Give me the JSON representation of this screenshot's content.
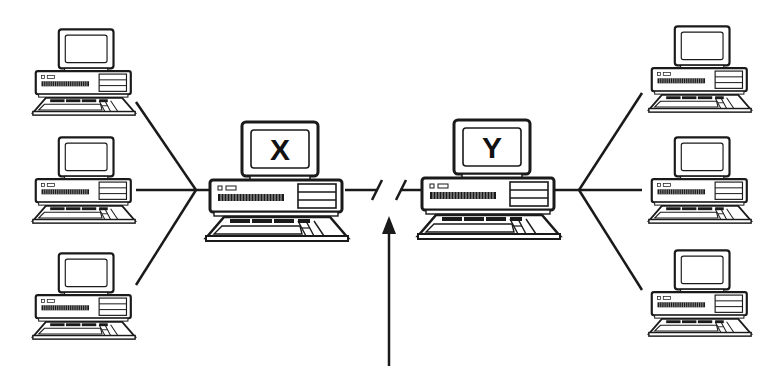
{
  "diagram": {
    "type": "network",
    "colors": {
      "ink": "#1a1a1a",
      "paper": "#ffffff",
      "shade": "#e6e6e6"
    },
    "hosts": [
      {
        "id": "X",
        "label": "X",
        "x": 205,
        "y": 118,
        "scale": 1.0
      },
      {
        "id": "Y",
        "label": "Y",
        "x": 418,
        "y": 118,
        "scale": 1.0
      }
    ],
    "clients_left": [
      {
        "x": 30,
        "y": 18,
        "scale": 0.72
      },
      {
        "x": 30,
        "y": 138,
        "scale": 0.72
      },
      {
        "x": 30,
        "y": 252,
        "scale": 0.72
      }
    ],
    "clients_right": [
      {
        "x": 638,
        "y": 18,
        "scale": 0.72
      },
      {
        "x": 638,
        "y": 138,
        "scale": 0.72
      },
      {
        "x": 638,
        "y": 252,
        "scale": 0.72
      }
    ],
    "hub_left": {
      "x": 196,
      "y": 190
    },
    "hub_right": {
      "x": 579,
      "y": 190
    },
    "link_break": {
      "left_x": 377,
      "right_x": 402,
      "y": 190
    },
    "arrow": {
      "x": 389,
      "y_tip": 216,
      "y_tail": 366
    }
  }
}
